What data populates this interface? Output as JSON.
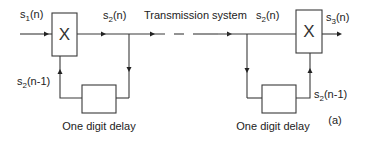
{
  "diagram": {
    "figure_label": "(a)",
    "channel_label": "Transmission system",
    "encoder": {
      "input_label": {
        "base": "s",
        "sub": "1",
        "arg": "(n)"
      },
      "output_label": {
        "base": "s",
        "sub": "2",
        "arg": "(n)"
      },
      "feedback_label": {
        "base": "s",
        "sub": "2",
        "arg": "(n-1)"
      },
      "multiplier_symbol": "X",
      "delay_label": "One digit delay"
    },
    "decoder": {
      "input_label": {
        "base": "s",
        "sub": "2",
        "arg": "(n)"
      },
      "output_label": {
        "base": "s",
        "sub": "3",
        "arg": "(n)"
      },
      "feedback_label": {
        "base": "s",
        "sub": "2",
        "arg": "(n-1)"
      },
      "multiplier_symbol": "X",
      "delay_label": "One digit delay"
    }
  }
}
